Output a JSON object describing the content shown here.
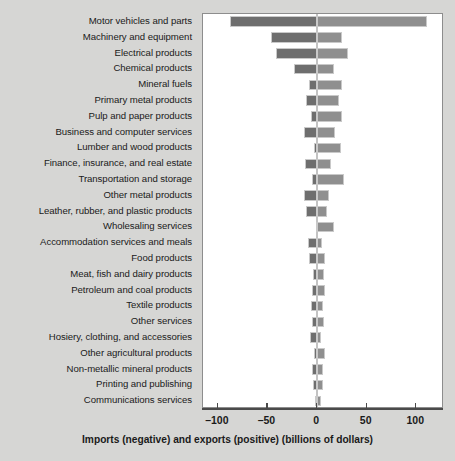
{
  "chart_data": {
    "type": "bar",
    "orientation": "horizontal",
    "title": "",
    "subtitle": "",
    "xlabel": "Imports (negative) and exports (positive) (billions of dollars)",
    "ylabel": "",
    "xlim": [
      -115,
      128
    ],
    "xticks": [
      -100,
      -50,
      0,
      50,
      100
    ],
    "xtick_labels": [
      "–100",
      "–50",
      "0",
      "50",
      "100"
    ],
    "grid": false,
    "legend": "none",
    "zero_reference_line": true,
    "colors": {
      "imports_bar": "#6e6e6e",
      "exports_bar": "#8f8f8f",
      "bar_outline": "#c9c9c9",
      "zero_line": "#c3c3c3",
      "plot_background": "#ffffff",
      "figure_background": "#d6d6d4",
      "axis": "#4a4a4a",
      "text": "#1a1a1a"
    },
    "series": [
      {
        "name": "Imports (negative)",
        "values": [
          -88,
          -46,
          -41,
          -23,
          -8,
          -11,
          -6,
          -13,
          -3,
          -12,
          -5,
          -13,
          -11,
          -1,
          -9,
          -8,
          -4,
          -5,
          -6,
          -5,
          -7,
          -3,
          -5,
          -4,
          -2
        ]
      },
      {
        "name": "Exports (positive)",
        "values": [
          111,
          25,
          31,
          17,
          25,
          22,
          25,
          18,
          24,
          14,
          27,
          12,
          10,
          17,
          5,
          8,
          7,
          8,
          6,
          7,
          4,
          8,
          6,
          6,
          4
        ]
      }
    ],
    "categories": [
      "Motor vehicles and parts",
      "Machinery and equipment",
      "Electrical products",
      "Chemical products",
      "Mineral fuels",
      "Primary metal products",
      "Pulp and paper products",
      "Business and computer services",
      "Lumber and wood products",
      "Finance, insurance, and real estate",
      "Transportation and storage",
      "Other metal products",
      "Leather, rubber, and plastic products",
      "Wholesaling services",
      "Accommodation services and meals",
      "Food products",
      "Meat, fish and dairy products",
      "Petroleum and coal products",
      "Textile products",
      "Other services",
      "Hosiery, clothing, and accessories",
      "Other agricultural products",
      "Non-metallic mineral products",
      "Printing and publishing",
      "Communications services"
    ]
  }
}
